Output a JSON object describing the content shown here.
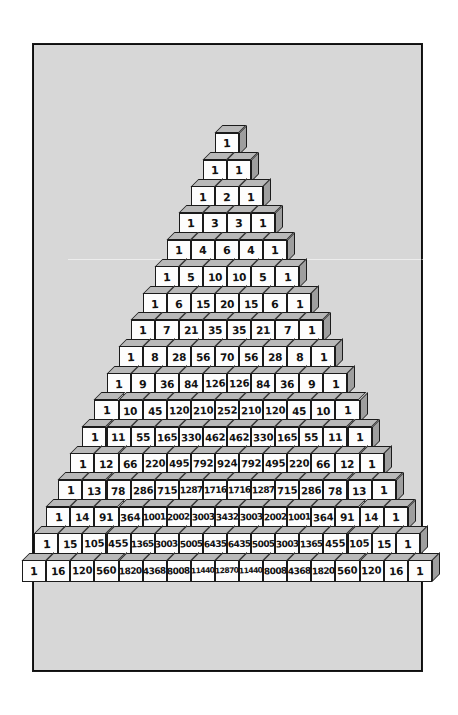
{
  "figure": {
    "name": "pascals-triangle-block-pyramid",
    "frame_color": "#1a1a1a",
    "paper_color": "#d7d7d7",
    "block_front_color": "#fdfdfd",
    "block_top_color": "#b9b9b9",
    "block_side_color": "#9e9e9e",
    "ink_color": "#111111",
    "rows_total": 17
  },
  "chart_data": {
    "type": "table",
    "xlabel": "",
    "ylabel": "",
    "grid": false,
    "legend": "none",
    "rows": [
      [
        1
      ],
      [
        1,
        1
      ],
      [
        1,
        2,
        1
      ],
      [
        1,
        3,
        3,
        1
      ],
      [
        1,
        4,
        6,
        4,
        1
      ],
      [
        1,
        5,
        10,
        10,
        5,
        1
      ],
      [
        1,
        6,
        15,
        20,
        15,
        6,
        1
      ],
      [
        1,
        7,
        21,
        35,
        35,
        21,
        7,
        1
      ],
      [
        1,
        8,
        28,
        56,
        70,
        56,
        28,
        8,
        1
      ],
      [
        1,
        9,
        36,
        84,
        126,
        126,
        84,
        36,
        9,
        1
      ],
      [
        1,
        10,
        45,
        120,
        210,
        252,
        210,
        120,
        45,
        10,
        1
      ],
      [
        1,
        11,
        55,
        165,
        330,
        462,
        462,
        330,
        165,
        55,
        11,
        1
      ],
      [
        1,
        12,
        66,
        220,
        495,
        792,
        924,
        792,
        495,
        220,
        66,
        12,
        1
      ],
      [
        1,
        13,
        78,
        286,
        715,
        1287,
        1716,
        1716,
        1287,
        715,
        286,
        78,
        13,
        1
      ],
      [
        1,
        14,
        91,
        364,
        1001,
        2002,
        3003,
        3432,
        3003,
        2002,
        1001,
        364,
        91,
        14,
        1
      ],
      [
        1,
        15,
        105,
        455,
        1365,
        3003,
        5005,
        6435,
        6435,
        5005,
        3003,
        1365,
        455,
        105,
        15,
        1
      ],
      [
        1,
        16,
        120,
        560,
        1820,
        4368,
        8008,
        11440,
        12870,
        11440,
        8008,
        4368,
        1820,
        560,
        120,
        16,
        1
      ]
    ]
  },
  "layout": {
    "block_width": 24.1,
    "block_height": 22,
    "row_pitch": 26.7,
    "depth": 7.5,
    "apex_center_x": 227,
    "bottom_row_top_y": 560
  }
}
